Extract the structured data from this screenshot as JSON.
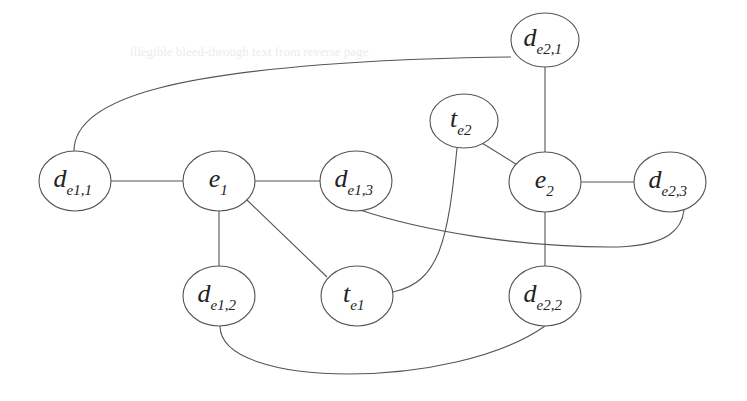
{
  "diagram": {
    "type": "graph",
    "colors": {
      "stroke": "#555555",
      "text": "#222222",
      "background": "#ffffff"
    },
    "nodes": [
      {
        "id": "de21",
        "base": "d",
        "sub": "e2,1",
        "cx": 545,
        "cy": 40,
        "rx": 34,
        "ry": 27
      },
      {
        "id": "te2",
        "base": "t",
        "sub": "e2",
        "cx": 464,
        "cy": 121,
        "rx": 34,
        "ry": 27
      },
      {
        "id": "de11",
        "base": "d",
        "sub": "e1,1",
        "cx": 75,
        "cy": 181,
        "rx": 36,
        "ry": 30
      },
      {
        "id": "e1",
        "base": "e",
        "sub": "1",
        "cx": 219,
        "cy": 181,
        "rx": 36,
        "ry": 30
      },
      {
        "id": "de13",
        "base": "d",
        "sub": "e1,3",
        "cx": 356,
        "cy": 181,
        "rx": 36,
        "ry": 30
      },
      {
        "id": "e2",
        "base": "e",
        "sub": "2",
        "cx": 545,
        "cy": 182,
        "rx": 36,
        "ry": 30
      },
      {
        "id": "de23",
        "base": "d",
        "sub": "e2,3",
        "cx": 670,
        "cy": 182,
        "rx": 36,
        "ry": 30
      },
      {
        "id": "de12",
        "base": "d",
        "sub": "e1,2",
        "cx": 219,
        "cy": 296,
        "rx": 36,
        "ry": 30
      },
      {
        "id": "te1",
        "base": "t",
        "sub": "e1",
        "cx": 357,
        "cy": 296,
        "rx": 36,
        "ry": 30
      },
      {
        "id": "de22",
        "base": "d",
        "sub": "e2,2",
        "cx": 545,
        "cy": 296,
        "rx": 36,
        "ry": 30
      }
    ],
    "edges": [
      {
        "from": "de11",
        "to": "e1",
        "path": "M111,181 L183,181"
      },
      {
        "from": "e1",
        "to": "de13",
        "path": "M255,181 L320,181"
      },
      {
        "from": "e1",
        "to": "de12",
        "path": "M219,211 L219,266"
      },
      {
        "from": "e1",
        "to": "te1",
        "path": "M247,200 L327,277"
      },
      {
        "from": "de11",
        "to": "de21",
        "path": "M74,151 C74,95 190,70 400,60 C450,58 490,57 511,57"
      },
      {
        "from": "de21",
        "to": "e2",
        "path": "M545,67 L545,152"
      },
      {
        "from": "te2",
        "to": "e2",
        "path": "M482,143 L519,166"
      },
      {
        "from": "e2",
        "to": "de23",
        "path": "M581,182 L634,182"
      },
      {
        "from": "e2",
        "to": "de22",
        "path": "M545,212 L545,270"
      },
      {
        "from": "te1",
        "to": "te2",
        "path": "M393,292 C440,282 448,240 457,148"
      },
      {
        "from": "de13",
        "to": "de23",
        "path": "M360,210 C420,230 520,248 618,247 C670,245 682,228 684,210"
      },
      {
        "from": "de12",
        "to": "de22",
        "path": "M220,326 C220,390 455,390 545,326"
      }
    ]
  },
  "background_bleed_text": [
    "illegible bleed-through text from reverse page"
  ]
}
